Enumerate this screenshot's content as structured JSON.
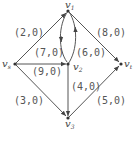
{
  "graph": {
    "nodes": [
      {
        "id": "v1",
        "label": "v",
        "sub": "1",
        "x": 68,
        "y": 11
      },
      {
        "id": "vs",
        "label": "v",
        "sub": "s",
        "x": 15,
        "y": 64
      },
      {
        "id": "v2",
        "label": "v",
        "sub": "2",
        "x": 68,
        "y": 64
      },
      {
        "id": "vt",
        "label": "v",
        "sub": "t",
        "x": 121,
        "y": 64
      },
      {
        "id": "v3",
        "label": "v",
        "sub": "3",
        "x": 68,
        "y": 118
      }
    ],
    "edges": [
      {
        "from": "vs",
        "to": "v1",
        "label": "(2,0)"
      },
      {
        "from": "v1",
        "to": "vt",
        "label": "(8,0)"
      },
      {
        "from": "v1",
        "to": "v2",
        "label": "(7,0)"
      },
      {
        "from": "v2",
        "to": "v1",
        "label": "(6,0)"
      },
      {
        "from": "vs",
        "to": "v2",
        "label": "(9,0)"
      },
      {
        "from": "v2",
        "to": "v3",
        "label": "(4,0)"
      },
      {
        "from": "vs",
        "to": "v3",
        "label": "(3,0)"
      },
      {
        "from": "v3",
        "to": "vt",
        "label": "(5,0)"
      }
    ]
  }
}
